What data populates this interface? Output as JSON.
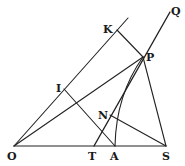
{
  "figure": {
    "type": "geometric-diagram",
    "points": {
      "O": {
        "label": "O",
        "x": 14,
        "y": 146
      },
      "T": {
        "label": "T",
        "x": 94,
        "y": 146
      },
      "A": {
        "label": "A",
        "x": 115,
        "y": 146
      },
      "S": {
        "label": "S",
        "x": 166,
        "y": 146
      },
      "P": {
        "label": "P",
        "x": 143,
        "y": 57
      },
      "K": {
        "label": "K",
        "x": 117,
        "y": 30
      },
      "I": {
        "label": "I",
        "x": 64,
        "y": 89
      },
      "N": {
        "label": "N",
        "x": 110,
        "y": 115
      },
      "Q": {
        "label": "Q",
        "x": 170,
        "y": 10
      }
    },
    "segments": [
      [
        "O",
        "S"
      ],
      [
        "O",
        "K-ext"
      ],
      [
        "O",
        "P"
      ],
      [
        "K",
        "P"
      ],
      [
        "P",
        "S"
      ],
      [
        "T",
        "Q"
      ],
      [
        "I",
        "A"
      ],
      [
        "N",
        "S"
      ],
      [
        "P",
        "A (arc)"
      ]
    ]
  }
}
